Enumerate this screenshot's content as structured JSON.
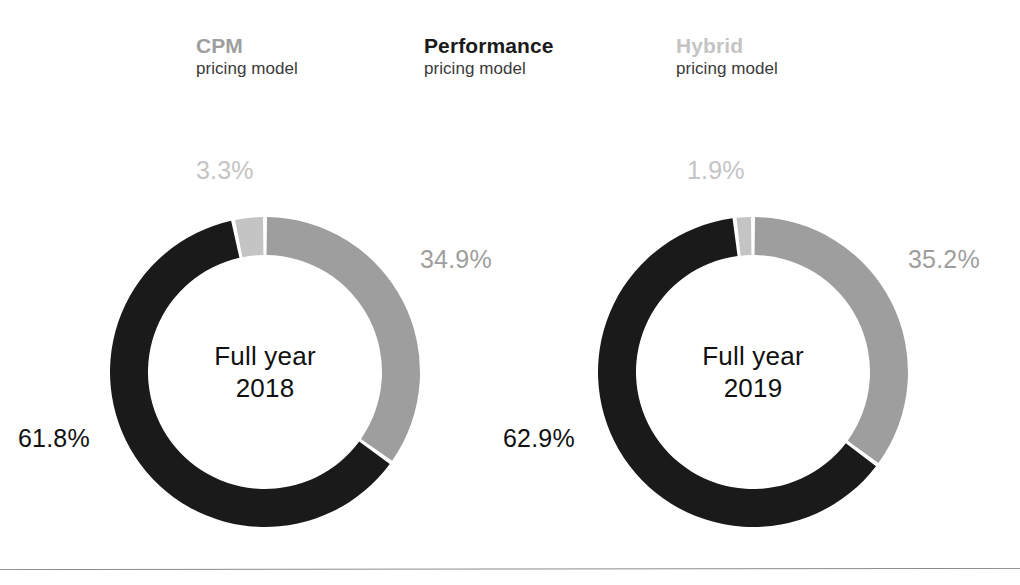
{
  "legend": {
    "items": [
      {
        "name": "cpm",
        "title": "CPM",
        "subtitle": "pricing model",
        "color": "#9e9e9e"
      },
      {
        "name": "performance",
        "title": "Performance",
        "subtitle": "pricing model",
        "color": "#1a1a1a"
      },
      {
        "name": "hybrid",
        "title": "Hybrid",
        "subtitle": "pricing model",
        "color": "#c4c4c4"
      }
    ]
  },
  "charts": [
    {
      "id": "2018",
      "center_line1": "Full year",
      "center_line2": "2018",
      "labels": {
        "hybrid": "3.3%",
        "cpm": "34.9%",
        "performance": "61.8%"
      }
    },
    {
      "id": "2019",
      "center_line1": "Full year",
      "center_line2": "2019",
      "labels": {
        "hybrid": "1.9%",
        "cpm": "35.2%",
        "performance": "62.9%"
      }
    }
  ],
  "colors": {
    "cpm": "#9e9e9e",
    "performance": "#1a1a1a",
    "hybrid": "#c4c4c4",
    "label_dark": "#111111",
    "subtitle": "#3a3a3a",
    "rule": "#8b8b8b"
  },
  "chart_data": {
    "type": "pie",
    "title": "",
    "subtitle": "",
    "xlabel": "",
    "ylabel": "",
    "legend_position": "top",
    "grid": false,
    "note": "Two donut (ring) charts showing revenue share by pricing model. Segments are drawn clockwise starting at 12 o'clock in order: CPM, Performance, Hybrid.",
    "categories": [
      "CPM pricing model",
      "Performance pricing model",
      "Hybrid pricing model"
    ],
    "units": "percent",
    "series": [
      {
        "name": "Full year 2018",
        "values": [
          34.9,
          61.8,
          3.3
        ]
      },
      {
        "name": "Full year 2019",
        "values": [
          35.2,
          62.9,
          1.9
        ]
      }
    ],
    "colors": [
      "#9e9e9e",
      "#1a1a1a",
      "#c4c4c4"
    ]
  }
}
